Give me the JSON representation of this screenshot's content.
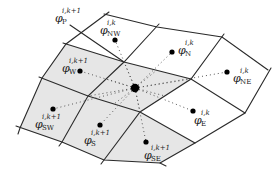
{
  "diagram": {
    "title": "",
    "type": "finite-volume stencil on curvilinear grid",
    "colors": {
      "shaded_cell": "#e6e6e6",
      "grid_line": "#2a2a2a",
      "node": "#000000",
      "dotted_link": "#555555",
      "background": "#ffffff"
    },
    "central_node": {
      "symbol": "φ",
      "sup": "i,k+1",
      "sub": "P"
    },
    "neighbors": [
      {
        "id": "NW",
        "symbol": "φ",
        "sup": "i,k",
        "sub": "NW",
        "shaded": false
      },
      {
        "id": "N",
        "symbol": "φ",
        "sup": "i,k",
        "sub": "N",
        "shaded": false
      },
      {
        "id": "NE",
        "symbol": "φ",
        "sup": "i,k",
        "sub": "NE",
        "shaded": false
      },
      {
        "id": "W",
        "symbol": "φ",
        "sup": "i,k+1",
        "sub": "W",
        "shaded": true
      },
      {
        "id": "E",
        "symbol": "φ",
        "sup": "i,k",
        "sub": "E",
        "shaded": false
      },
      {
        "id": "SW",
        "symbol": "φ",
        "sup": "i,k+1",
        "sub": "SW",
        "shaded": true
      },
      {
        "id": "S",
        "symbol": "φ",
        "sup": "i,k+1",
        "sub": "S",
        "shaded": true
      },
      {
        "id": "SE",
        "symbol": "φ",
        "sup": "i,k+1",
        "sub": "SE",
        "shaded": true
      }
    ]
  }
}
